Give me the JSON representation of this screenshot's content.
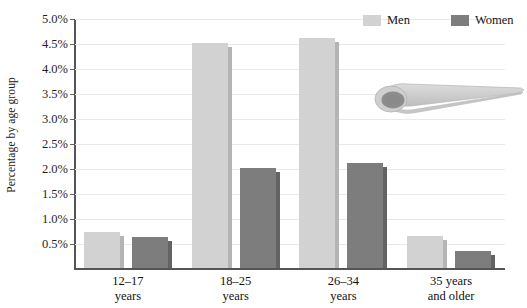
{
  "chart_data": {
    "type": "bar",
    "title": "",
    "xlabel": "",
    "ylabel": "Percentage by age group",
    "categories": [
      "12–17 years",
      "18–25 years",
      "26–34 years",
      "35 years and older"
    ],
    "category_lines": [
      [
        "12–17",
        "years"
      ],
      [
        "18–25",
        "years"
      ],
      [
        "26–34",
        "years"
      ],
      [
        "35 years",
        "and older"
      ]
    ],
    "series": [
      {
        "name": "Men",
        "color": "#d2d2d2",
        "values": [
          0.72,
          4.5,
          4.6,
          0.65
        ]
      },
      {
        "name": "Women",
        "color": "#7d7d7d",
        "values": [
          0.62,
          2.0,
          2.1,
          0.35
        ]
      }
    ],
    "ylim": [
      0,
      5.0
    ],
    "ytick_values": [
      0.5,
      1.0,
      1.5,
      2.0,
      2.5,
      3.0,
      3.5,
      4.0,
      4.5,
      5.0
    ],
    "ytick_labels": [
      "0.5%",
      "1.0%",
      "1.5%",
      "2.0%",
      "2.5%",
      "3.0%",
      "3.5%",
      "4.0%",
      "4.5%",
      "5.0%"
    ],
    "grid": true,
    "legend_position": "top-right",
    "value_unit": "percent"
  },
  "legend": {
    "entries": [
      {
        "label": "Men",
        "color": "#d2d2d2"
      },
      {
        "label": "Women",
        "color": "#7d7d7d"
      }
    ]
  },
  "decoration": {
    "icon_name": "cigarette-graphic",
    "body_color": "#c9c9c9",
    "opening_color": "#8d8d8d"
  },
  "colors": {
    "men": "#d2d2d2",
    "women": "#7d7d7d",
    "gridline": "#e9e9e9",
    "axis": "#555555",
    "text": "#1b1b1b",
    "background": "#ffffff"
  }
}
